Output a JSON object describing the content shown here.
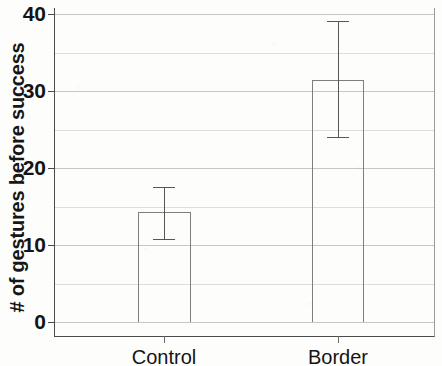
{
  "chart_data": {
    "type": "bar",
    "title": "",
    "xlabel": "",
    "ylabel": "# of gestures before success",
    "categories": [
      "Control",
      "Border"
    ],
    "values": [
      14.3,
      31.4
    ],
    "error_low": [
      10.8,
      24.0
    ],
    "error_high": [
      17.5,
      39.1
    ],
    "ylim": [
      0,
      40
    ],
    "yticks": [
      0,
      10,
      20,
      30,
      40
    ],
    "ytick_labels": [
      "0",
      "10",
      "20",
      "30",
      "40"
    ],
    "gridlines_minor": [
      5,
      15,
      25,
      35
    ],
    "grid": true,
    "legend": "none",
    "bar_fill": "#ffffff",
    "bar_edge": "#7e7e7e",
    "error_color": "#565656",
    "axis_color": "#4a4a4a"
  },
  "axes": {
    "y_title": "# of gestures before success",
    "y_ticks": [
      {
        "label": "40",
        "value": 40
      },
      {
        "label": "30",
        "value": 30
      },
      {
        "label": "20",
        "value": 20
      },
      {
        "label": "10",
        "value": 10
      },
      {
        "label": "0",
        "value": 0
      }
    ],
    "x_ticks": [
      {
        "label": "Control",
        "value": 0
      },
      {
        "label": "Border",
        "value": 1
      }
    ]
  },
  "series": [
    {
      "name": "Control",
      "value": 14.3,
      "err_low": 10.8,
      "err_high": 17.5
    },
    {
      "name": "Border",
      "value": 31.4,
      "err_low": 24.0,
      "err_high": 39.1
    }
  ]
}
